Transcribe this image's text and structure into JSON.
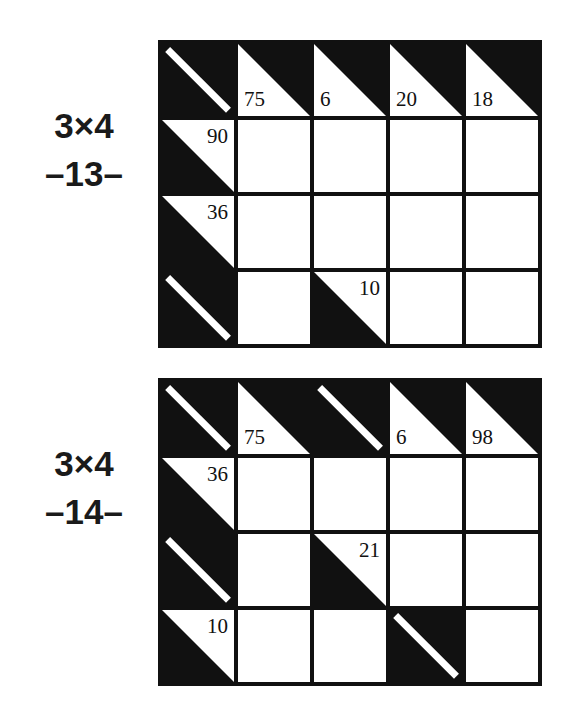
{
  "page": {
    "background_color": "#ffffff",
    "ink_color": "#111111"
  },
  "puzzles": [
    {
      "id": "puzzle-13",
      "label": {
        "size": "3×4",
        "number": "–13–"
      },
      "grid": {
        "rows": 4,
        "cols": 5,
        "cells": [
          [
            {
              "type": "slash"
            },
            {
              "type": "clue-top",
              "value": "75"
            },
            {
              "type": "clue-top",
              "value": "6"
            },
            {
              "type": "clue-top",
              "value": "20"
            },
            {
              "type": "clue-top",
              "value": "18"
            }
          ],
          [
            {
              "type": "clue-left",
              "value": "90"
            },
            {
              "type": "empty"
            },
            {
              "type": "empty"
            },
            {
              "type": "empty"
            },
            {
              "type": "empty"
            }
          ],
          [
            {
              "type": "clue-left",
              "value": "36"
            },
            {
              "type": "empty"
            },
            {
              "type": "empty"
            },
            {
              "type": "empty"
            },
            {
              "type": "empty"
            }
          ],
          [
            {
              "type": "slash"
            },
            {
              "type": "empty"
            },
            {
              "type": "clue-inner",
              "value": "10"
            },
            {
              "type": "empty"
            },
            {
              "type": "empty"
            }
          ]
        ]
      }
    },
    {
      "id": "puzzle-14",
      "label": {
        "size": "3×4",
        "number": "–14–"
      },
      "grid": {
        "rows": 4,
        "cols": 5,
        "cells": [
          [
            {
              "type": "slash"
            },
            {
              "type": "clue-top",
              "value": "75"
            },
            {
              "type": "slash"
            },
            {
              "type": "clue-top",
              "value": "6"
            },
            {
              "type": "clue-top",
              "value": "98"
            }
          ],
          [
            {
              "type": "clue-left",
              "value": "36"
            },
            {
              "type": "empty"
            },
            {
              "type": "empty"
            },
            {
              "type": "empty"
            },
            {
              "type": "empty"
            }
          ],
          [
            {
              "type": "slash"
            },
            {
              "type": "empty"
            },
            {
              "type": "clue-inner",
              "value": "21"
            },
            {
              "type": "empty"
            },
            {
              "type": "empty"
            }
          ],
          [
            {
              "type": "clue-left",
              "value": "10"
            },
            {
              "type": "empty"
            },
            {
              "type": "empty"
            },
            {
              "type": "slash"
            },
            {
              "type": "empty"
            }
          ]
        ]
      }
    }
  ]
}
